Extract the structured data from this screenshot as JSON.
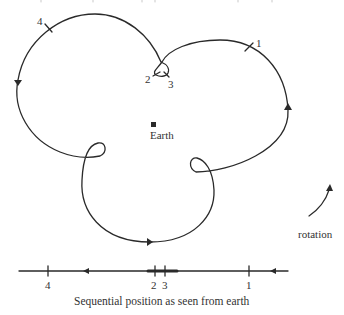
{
  "diagram": {
    "title_fragment": "",
    "center_label": "Earth",
    "orbit_markers": [
      {
        "id": "1",
        "label": "1"
      },
      {
        "id": "2",
        "label": "2"
      },
      {
        "id": "3",
        "label": "3"
      },
      {
        "id": "4",
        "label": "4"
      }
    ],
    "rotation_label": "rotation",
    "line_markers": [
      {
        "id": "4",
        "label": "4"
      },
      {
        "id": "2",
        "label": "2"
      },
      {
        "id": "3",
        "label": "3"
      },
      {
        "id": "1",
        "label": "1"
      }
    ],
    "caption": "Sequential position as seen from earth",
    "colors": {
      "stroke": "#2a2a2a",
      "background": "#ffffff"
    }
  }
}
